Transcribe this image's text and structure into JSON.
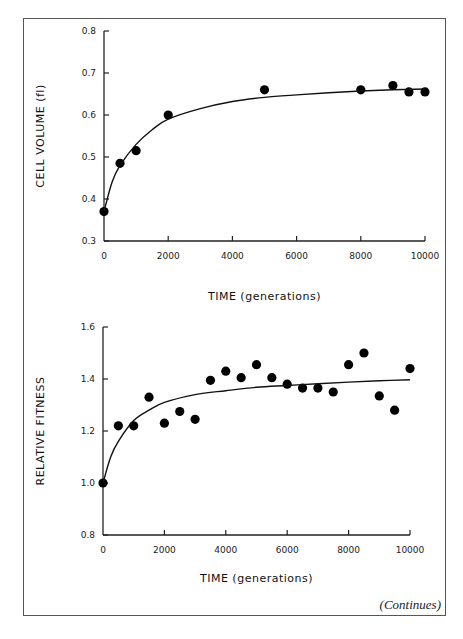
{
  "header": {
    "text": "...ying generations..."
  },
  "footer": {
    "continues_label": "(Continues)"
  },
  "chart_data": [
    {
      "type": "scatter",
      "title": "",
      "xlabel": "TIME (generations)",
      "ylabel": "CELL VOLUME (fl)",
      "xlim": [
        0,
        10000
      ],
      "ylim": [
        0.3,
        0.8
      ],
      "xticks": [
        0,
        2000,
        4000,
        6000,
        8000,
        10000
      ],
      "xtick_labels": [
        "0",
        "2000",
        "4000",
        "6000",
        "8000",
        "10000"
      ],
      "yticks": [
        0.3,
        0.4,
        0.5,
        0.6,
        0.7,
        0.8
      ],
      "ytick_labels": [
        "0.3",
        "0.4",
        "0.5",
        "0.6",
        "0.7",
        "0.8"
      ],
      "grid": false,
      "series": [
        {
          "name": "observed",
          "x": [
            0,
            500,
            1000,
            2000,
            5000,
            8000,
            9000,
            9500,
            10000
          ],
          "y": [
            0.37,
            0.485,
            0.515,
            0.6,
            0.66,
            0.66,
            0.67,
            0.655,
            0.655
          ]
        },
        {
          "name": "fitted hyperbolic curve",
          "type": "line",
          "x": [
            0,
            250,
            500,
            1000,
            1500,
            2000,
            3000,
            4000,
            5000,
            6000,
            7000,
            8000,
            9000,
            10000
          ],
          "y": [
            0.37,
            0.44,
            0.48,
            0.53,
            0.565,
            0.59,
            0.615,
            0.632,
            0.642,
            0.648,
            0.653,
            0.657,
            0.66,
            0.662
          ]
        }
      ]
    },
    {
      "type": "scatter",
      "title": "",
      "xlabel": "TIME (generations)",
      "ylabel": "RELATIVE FITNESS",
      "xlim": [
        0,
        10000
      ],
      "ylim": [
        0.8,
        1.6
      ],
      "xticks": [
        0,
        2000,
        4000,
        6000,
        8000,
        10000
      ],
      "xtick_labels": [
        "0",
        "2000",
        "4000",
        "6000",
        "8000",
        "10000"
      ],
      "yticks": [
        0.8,
        1.0,
        1.2,
        1.4,
        1.6
      ],
      "ytick_labels": [
        "0.8",
        "1.0",
        "1.2",
        "1.4",
        "1.6"
      ],
      "grid": false,
      "series": [
        {
          "name": "observed",
          "x": [
            0,
            500,
            1000,
            1500,
            2000,
            2500,
            3000,
            3500,
            4000,
            4500,
            5000,
            5500,
            6000,
            6500,
            7000,
            7500,
            8000,
            8500,
            9000,
            9500,
            10000
          ],
          "y": [
            1.0,
            1.22,
            1.22,
            1.33,
            1.23,
            1.275,
            1.245,
            1.395,
            1.43,
            1.405,
            1.455,
            1.405,
            1.38,
            1.365,
            1.365,
            1.35,
            1.455,
            1.5,
            1.335,
            1.28,
            1.44
          ]
        },
        {
          "name": "fitted hyperbolic curve",
          "type": "line",
          "x": [
            0,
            250,
            500,
            1000,
            1500,
            2000,
            3000,
            4000,
            5000,
            6000,
            7000,
            8000,
            9000,
            10000
          ],
          "y": [
            1.0,
            1.1,
            1.16,
            1.24,
            1.28,
            1.31,
            1.34,
            1.355,
            1.368,
            1.375,
            1.382,
            1.388,
            1.393,
            1.397
          ]
        }
      ]
    }
  ]
}
